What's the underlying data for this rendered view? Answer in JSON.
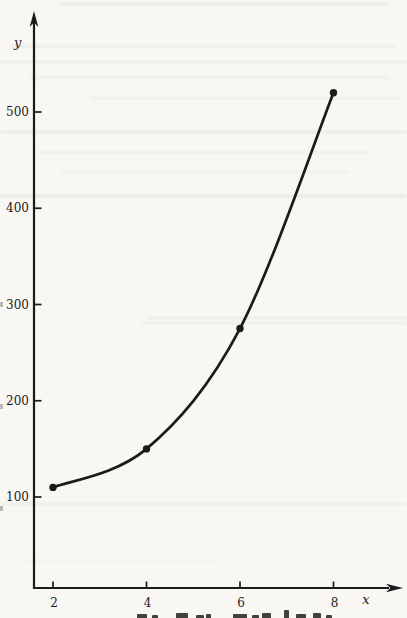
{
  "page": {
    "background_color": "#f8f7f3",
    "ink_color": "#1b1b1b"
  },
  "chart_data": {
    "type": "line",
    "x": [
      2,
      4,
      6,
      8
    ],
    "y": [
      110,
      150,
      275,
      520
    ],
    "series": [
      {
        "name": "plotted-curve",
        "values": [
          110,
          150,
          275,
          520
        ]
      }
    ],
    "title": "",
    "xlabel": "x",
    "ylabel": "y",
    "x_ticks": [
      2,
      4,
      6,
      8
    ],
    "y_ticks": [
      100,
      200,
      300,
      400,
      500
    ],
    "x_tick_labels": [
      "2",
      "4",
      "6",
      "8"
    ],
    "y_tick_labels": [
      "100",
      "200",
      "300",
      "400",
      "500"
    ],
    "xlim": [
      0.6,
      9.9
    ],
    "ylim": [
      0,
      600
    ],
    "grid": false,
    "legend_position": "none",
    "marker": "filled-circle",
    "line_style": "smooth-curve",
    "axis_arrows": true,
    "line_color": "#1b1b1b"
  }
}
